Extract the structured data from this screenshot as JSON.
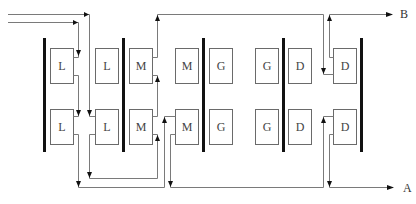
{
  "diagram": {
    "outputs": {
      "top": "B",
      "bottom": "A"
    },
    "top_row": [
      {
        "label": "L"
      },
      {
        "label": "L"
      },
      {
        "label": "M"
      },
      {
        "label": "M"
      },
      {
        "label": "G"
      },
      {
        "label": "G"
      },
      {
        "label": "D"
      },
      {
        "label": "D"
      }
    ],
    "bottom_row": [
      {
        "label": "L"
      },
      {
        "label": "L"
      },
      {
        "label": "M"
      },
      {
        "label": "M"
      },
      {
        "label": "G"
      },
      {
        "label": "G"
      },
      {
        "label": "D"
      },
      {
        "label": "D"
      }
    ],
    "bar_count": 6,
    "colors": {
      "bar": "#111111",
      "box_stroke": "#6a6a6a",
      "wire": "#7a7a7a"
    }
  }
}
